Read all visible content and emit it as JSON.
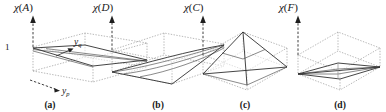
{
  "figure": {
    "background": "#ffffff",
    "ink_color": "#232323",
    "grid_color": "#9a9a9a",
    "width": 386,
    "height": 112
  },
  "axes": {
    "vertical_symbol": "χ",
    "horizontal_front": {
      "symbol": "y",
      "subscript": "p"
    },
    "horizontal_side": {
      "symbol": "y",
      "subscript": "q"
    },
    "tick_value": "1"
  },
  "panels": [
    {
      "caption": "(a)",
      "vertical_axis": {
        "chi": "χ",
        "open": "(",
        "arg": "A",
        "close": ")"
      },
      "relation": "A",
      "shows_tick": true,
      "shows_yp_label": true,
      "shows_yq_label": true,
      "surface": "near-planar sheet tilted from unit height at the left corner down toward the right",
      "surface_type": "tilted-plane"
    },
    {
      "caption": "(b)",
      "vertical_axis": {
        "chi": "χ",
        "open": "(",
        "arg": "D",
        "close": ")"
      },
      "relation": "D",
      "shows_tick": false,
      "shows_yp_label": false,
      "shows_yq_label": false,
      "surface": "twisted ruled saddle rising diagonally from the front-left base corner to the far-right top corner",
      "surface_type": "twisted-saddle"
    },
    {
      "caption": "(c)",
      "vertical_axis": {
        "chi": "χ",
        "open": "(",
        "arg": "C",
        "close": ")"
      },
      "relation": "C",
      "shows_tick": false,
      "shows_yp_label": false,
      "shows_yq_label": false,
      "surface": "pyramidal tent peaking at the rear-top vertex with straight ridges to the base corners",
      "surface_type": "pyramid-tent"
    },
    {
      "caption": "(d)",
      "vertical_axis": {
        "chi": "χ",
        "open": "(",
        "arg": "F",
        "close": ")"
      },
      "relation": "F",
      "shows_tick": false,
      "shows_yp_label": false,
      "shows_yq_label": false,
      "surface": "shallow flattened sheet lying along the base diagonal between the left and right base corners",
      "surface_type": "flat-diagonal-sheet"
    }
  ]
}
